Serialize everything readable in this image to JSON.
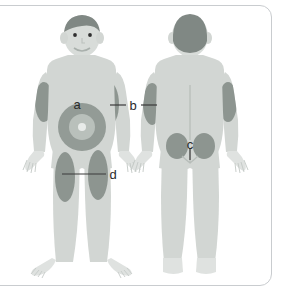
{
  "figure": {
    "views": [
      {
        "name": "front-view",
        "label": "Front view"
      },
      {
        "name": "back-view",
        "label": "Back view"
      }
    ]
  },
  "labels": [
    {
      "id": "a",
      "text": "a",
      "site": "abdomen",
      "view": "front",
      "has_leader_line": false
    },
    {
      "id": "b",
      "text": "b",
      "site": "upper-arm",
      "view": "front-and-back",
      "has_leader_line": true
    },
    {
      "id": "c",
      "text": "c",
      "site": "buttock",
      "view": "back",
      "has_leader_line": true
    },
    {
      "id": "d",
      "text": "d",
      "site": "thigh",
      "view": "front",
      "has_leader_line": true
    }
  ],
  "colors": {
    "background": "#ffffff",
    "frame_border": "#c9cccf",
    "body_fill": "#d2d6d3",
    "body_shade": "#c5c9c6",
    "patch_fill": "#8d9590",
    "patch_fill_dark": "#7f8883",
    "hair": "#808884",
    "target_outer": "#939b96",
    "target_inner": "#b9c0bb",
    "target_center": "#e6e9e7",
    "leader_line": "#3a3a3a",
    "label_text": "#2b2b2b",
    "detail_line": "#b6bcb8"
  },
  "markers": {
    "abdomen_target": "concentric-circles",
    "spine_line": "vertical-line",
    "gluteal_cleft": "curve"
  }
}
